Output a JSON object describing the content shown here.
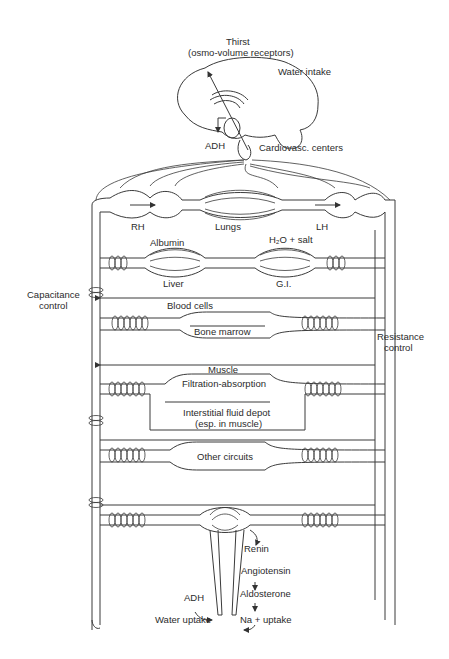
{
  "diagram": {
    "brain": {
      "thirst": "Thirst",
      "receptors": "(osmo-volume receptors)",
      "water_intake": "Water intake",
      "adh": "ADH",
      "cardiovasc_centers": "Cardiovasc. centers"
    },
    "heart_lungs": {
      "right_heart": "RH",
      "lungs": "Lungs",
      "left_heart": "LH"
    },
    "splanchnic": {
      "albumin": "Albumin",
      "water_salt": "H₂O + salt",
      "liver": "Liver",
      "gi": "G.I."
    },
    "side_labels": {
      "capacitance_line1": "Capacitance",
      "capacitance_line2": "control",
      "resistance_line1": "Resistance",
      "resistance_line2": "control"
    },
    "marrow": {
      "blood_cells": "Blood cells",
      "bone_marrow": "Bone marrow"
    },
    "muscle": {
      "muscle": "Muscle",
      "filtration": "Filtration-absorption",
      "interstitial_line1": "Interstitial fluid depot",
      "interstitial_line2": "(esp. in muscle)"
    },
    "other": {
      "other_circuits": "Other circuits"
    },
    "kidney": {
      "renin": "Renin",
      "angiotensin": "Angiotensin",
      "aldosterone": "Aldosterone",
      "adh": "ADH",
      "water_uptake": "Water uptake",
      "na_uptake": "Na + uptake"
    }
  }
}
